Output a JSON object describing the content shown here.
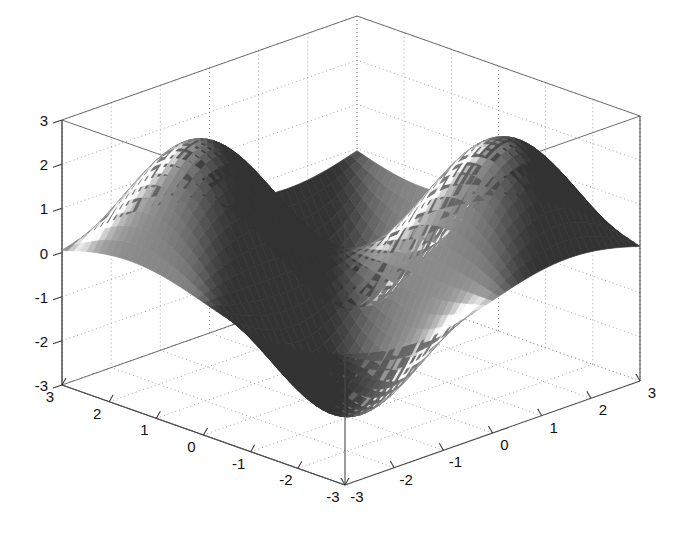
{
  "figure": {
    "type": "surface-plot-3d",
    "background_color": "#ffffff",
    "axis_color": "#4a4a4a",
    "grid_color": "#9a9a9a",
    "label_color": "#111111",
    "surface_dark": "#4f4f4f",
    "surface_mid": "#8c8c8c",
    "surface_light": "#e8e8e8"
  },
  "chart_data": {
    "type": "surface",
    "title": "",
    "xlabel": "",
    "ylabel": "",
    "zlabel": "",
    "grid": true,
    "legend": "none",
    "colormap": "gray",
    "shading": "interp",
    "function": "z = 2.5 * sin(x) * sin(y)",
    "xlim": [
      -3,
      3
    ],
    "ylim": [
      -3,
      3
    ],
    "zlim": [
      -3,
      3
    ],
    "x_ticks": [
      -3,
      -2,
      -1,
      0,
      1,
      2,
      3
    ],
    "y_ticks": [
      -3,
      -2,
      -1,
      0,
      1,
      2,
      3
    ],
    "z_ticks": [
      -3,
      -2,
      -1,
      0,
      1,
      2,
      3
    ],
    "x_tick_labels": [
      "-3",
      "-2",
      "-1",
      "0",
      "1",
      "2",
      "3"
    ],
    "y_tick_labels": [
      "3",
      "2",
      "1",
      "0",
      "-1",
      "-2",
      "-3"
    ],
    "z_tick_labels": [
      "3",
      "2",
      "1",
      "0",
      "-1",
      "-2",
      "-3"
    ],
    "view_azimuth": -37.5,
    "view_elevation": 30,
    "mesh_resolution": 46,
    "z_min_observed": -2.5,
    "z_max_observed": 2.5,
    "peaks": [
      {
        "x": -1.57,
        "y": -1.57,
        "z": 2.5
      },
      {
        "x": 1.57,
        "y": 1.57,
        "z": 2.5
      },
      {
        "x": -1.57,
        "y": 1.57,
        "z": -2.5
      },
      {
        "x": 1.57,
        "y": -1.57,
        "z": -2.5
      }
    ]
  },
  "axes": {
    "z_axis": {
      "name": "z-axis",
      "ticks": [
        "3",
        "2",
        "1",
        "0",
        "-1",
        "-2",
        "-3"
      ]
    },
    "x_axis_left": {
      "name": "left-bottom-axis",
      "ticks": [
        "3",
        "2",
        "1",
        "0",
        "-1",
        "-2",
        "-3"
      ]
    },
    "y_axis_right": {
      "name": "right-bottom-axis",
      "ticks": [
        "-3",
        "-2",
        "-1",
        "0",
        "1",
        "2",
        "3"
      ]
    }
  }
}
